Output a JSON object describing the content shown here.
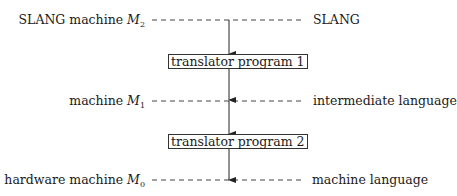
{
  "levels": [
    {
      "machine_label": "SLANG machine",
      "machine_symbol": "M",
      "machine_subscript": "2",
      "language_label": "SLANG"
    },
    {
      "machine_label": "machine",
      "machine_symbol": "M",
      "machine_subscript": "1",
      "language_label": "intermediate language"
    },
    {
      "machine_label": "hardware machine",
      "machine_symbol": "M",
      "machine_subscript": "0",
      "language_label": "machine language"
    }
  ],
  "translators": [
    {
      "label": "translator program 1"
    },
    {
      "label": "translator program 2"
    }
  ],
  "colors": {
    "line": "#333333",
    "text": "#1a1a1a",
    "background": "#ffffff"
  }
}
